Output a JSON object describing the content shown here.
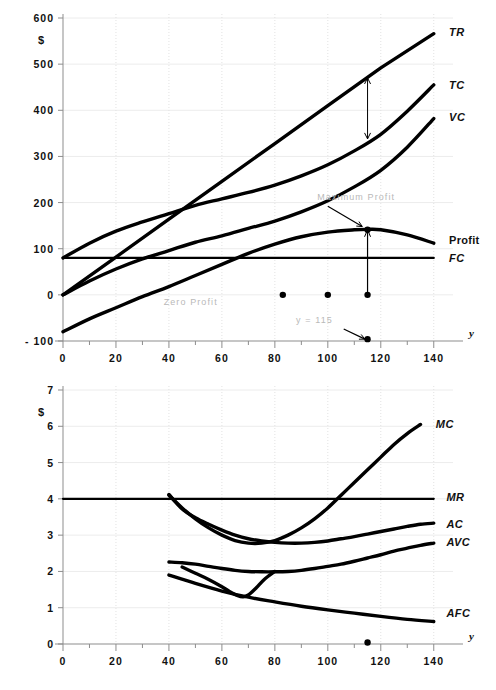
{
  "figure": {
    "title": "",
    "panels": [
      "total-curves-panel",
      "average-marginal-curves-panel"
    ]
  },
  "chart_data": [
    {
      "id": "totals",
      "type": "line",
      "title": "",
      "xlabel": "y",
      "ylabel": "$",
      "xlim": [
        0,
        145
      ],
      "ylim": [
        -100,
        600
      ],
      "xticks": [
        0,
        20,
        40,
        60,
        80,
        100,
        120,
        140
      ],
      "xtick_labels": [
        "0",
        "20",
        "40",
        "60",
        "80",
        "100",
        "120",
        "140"
      ],
      "xminor_step": 10,
      "yticks": [
        -100,
        0,
        100,
        200,
        300,
        400,
        500,
        600
      ],
      "ytick_labels": [
        "- 100",
        "0",
        "100",
        "200",
        "300",
        "400",
        "500",
        "600"
      ],
      "grid": true,
      "legend": "right-inline",
      "series": [
        {
          "name": "TR",
          "label": "TR",
          "label_xy": [
            142,
            570
          ],
          "x": [
            0,
            20,
            40,
            60,
            80,
            100,
            120,
            140
          ],
          "y": [
            0,
            82,
            164,
            246,
            328,
            410,
            492,
            566
          ]
        },
        {
          "name": "TC",
          "label": "TC",
          "label_xy": [
            142,
            455
          ],
          "x": [
            0,
            10,
            20,
            30,
            40,
            50,
            60,
            70,
            80,
            90,
            100,
            110,
            120,
            130,
            140
          ],
          "y": [
            80,
            112,
            138,
            158,
            176,
            194,
            208,
            222,
            238,
            258,
            282,
            312,
            348,
            398,
            455
          ]
        },
        {
          "name": "VC",
          "label": "VC",
          "label_xy": [
            142,
            385
          ],
          "x": [
            0,
            10,
            20,
            30,
            40,
            50,
            60,
            70,
            80,
            90,
            100,
            110,
            120,
            130,
            140
          ],
          "y": [
            0,
            30,
            56,
            78,
            96,
            114,
            128,
            144,
            160,
            180,
            204,
            234,
            270,
            320,
            382
          ]
        },
        {
          "name": "Profit",
          "label": "Profit",
          "label_xy": [
            142,
            118
          ],
          "x": [
            0,
            10,
            20,
            30,
            40,
            50,
            60,
            70,
            80,
            90,
            100,
            110,
            115,
            120,
            130,
            140
          ],
          "y": [
            -80,
            -52,
            -28,
            -4,
            18,
            42,
            66,
            90,
            110,
            126,
            136,
            141,
            142,
            141,
            130,
            112
          ]
        },
        {
          "name": "FC",
          "label": "FC",
          "label_xy": [
            142,
            80
          ],
          "x": [
            0,
            140
          ],
          "y": [
            80,
            80
          ]
        }
      ],
      "annotations": [
        {
          "name": "maximum-profit-label",
          "text": "Maximum Profit",
          "x": 96,
          "y": 205,
          "style": "faint"
        },
        {
          "name": "zero-profit-label",
          "text": "Zero Profit",
          "x": 38,
          "y": -22,
          "style": "faint"
        },
        {
          "name": "y-equals-115-label",
          "text": "y  =  115",
          "x": 88,
          "y": -62,
          "style": "faint"
        },
        {
          "name": "profit-gap-arrow",
          "kind": "double-arrow",
          "x": 115,
          "y_from": 338,
          "y_to": 470
        },
        {
          "name": "max-profit-drop-line",
          "kind": "stem",
          "x": 115,
          "y_from": 0,
          "y_to": 141
        },
        {
          "name": "max-profit-pointer",
          "kind": "arrow",
          "x_from": 100,
          "y_from": 192,
          "x_to": 113,
          "y_to": 148
        },
        {
          "name": "y-115-pointer",
          "kind": "arrow",
          "x_from": 106,
          "y_from": -74,
          "x_to": 114,
          "y_to": -96
        }
      ],
      "markers": [
        {
          "name": "zero-profit-marker",
          "x": 83,
          "y": 0
        },
        {
          "name": "mid-marker",
          "x": 100,
          "y": 0
        },
        {
          "name": "max-profit-marker",
          "x": 115,
          "y": 0
        },
        {
          "name": "max-profit-peak-marker",
          "x": 115,
          "y": 141
        },
        {
          "name": "axis-115-marker",
          "x": 115,
          "y": -96
        }
      ]
    },
    {
      "id": "averages",
      "type": "line",
      "title": "",
      "xlabel": "y",
      "ylabel": "$",
      "xlim": [
        0,
        145
      ],
      "ylim": [
        0,
        7
      ],
      "xticks": [
        0,
        20,
        40,
        60,
        80,
        100,
        120,
        140
      ],
      "xtick_labels": [
        "0",
        "20",
        "40",
        "60",
        "80",
        "100",
        "120",
        "140"
      ],
      "xminor_step": 10,
      "yticks": [
        0,
        1,
        2,
        3,
        4,
        5,
        6,
        7
      ],
      "ytick_labels": [
        "0",
        "1",
        "2",
        "3",
        "4",
        "5",
        "6",
        "7"
      ],
      "grid": true,
      "legend": "right-inline",
      "series": [
        {
          "name": "MC",
          "label": "MC",
          "label_xy": [
            137,
            6.05
          ],
          "x": [
            40,
            45,
            50,
            55,
            60,
            65,
            70,
            75,
            80,
            85,
            90,
            95,
            100,
            105,
            110,
            115,
            120,
            125,
            130,
            135
          ],
          "y": [
            4.1,
            3.75,
            3.45,
            3.2,
            3.0,
            2.85,
            2.78,
            2.78,
            2.85,
            3.0,
            3.2,
            3.45,
            3.75,
            4.1,
            4.45,
            4.8,
            5.15,
            5.5,
            5.8,
            6.05
          ]
        },
        {
          "name": "MR",
          "label": "MR",
          "label_xy": [
            141,
            4.05
          ],
          "x": [
            0,
            140
          ],
          "y": [
            4.0,
            4.0
          ]
        },
        {
          "name": "AC",
          "label": "AC",
          "label_xy": [
            141,
            3.3
          ],
          "x": [
            40,
            45,
            50,
            55,
            60,
            65,
            70,
            75,
            80,
            85,
            90,
            95,
            100,
            105,
            110,
            115,
            120,
            125,
            130,
            135,
            140
          ],
          "y": [
            4.12,
            3.72,
            3.48,
            3.3,
            3.14,
            3.0,
            2.9,
            2.84,
            2.8,
            2.78,
            2.78,
            2.8,
            2.84,
            2.9,
            2.96,
            3.03,
            3.1,
            3.17,
            3.24,
            3.3,
            3.33
          ]
        },
        {
          "name": "AVC",
          "label": "AVC",
          "label_xy": [
            141,
            2.8
          ],
          "x": [
            40,
            45,
            50,
            55,
            60,
            65,
            70,
            75,
            80,
            85,
            90,
            95,
            100,
            105,
            110,
            115,
            120,
            125,
            130,
            135,
            140
          ],
          "y": [
            2.26,
            2.24,
            2.2,
            2.14,
            2.08,
            2.03,
            2.0,
            1.99,
            1.99,
            2.0,
            2.03,
            2.08,
            2.14,
            2.2,
            2.28,
            2.37,
            2.46,
            2.56,
            2.64,
            2.72,
            2.78
          ]
        },
        {
          "name": "AFC",
          "label": "AFC",
          "label_xy": [
            141,
            0.86
          ],
          "x": [
            40,
            50,
            60,
            70,
            80,
            90,
            100,
            110,
            120,
            130,
            140
          ],
          "y": [
            1.9,
            1.67,
            1.46,
            1.29,
            1.16,
            1.04,
            0.94,
            0.85,
            0.76,
            0.68,
            0.62
          ]
        },
        {
          "name": "AVC-dip",
          "label": "",
          "label_xy": [
            0,
            0
          ],
          "x": [
            45,
            50,
            55,
            60,
            63,
            66,
            68,
            70,
            73,
            76,
            80
          ],
          "y": [
            2.12,
            1.95,
            1.78,
            1.58,
            1.44,
            1.33,
            1.3,
            1.35,
            1.55,
            1.78,
            2.0
          ]
        }
      ],
      "annotations": [],
      "markers": [
        {
          "name": "axis-115-marker-lower",
          "x": 115,
          "y": 0.04
        }
      ]
    }
  ],
  "colors": {
    "curve": "#000000",
    "grid": "#ececec",
    "axis": "#8d8d8d",
    "faint_text": "#b9b9b9",
    "background": "#ffffff"
  }
}
